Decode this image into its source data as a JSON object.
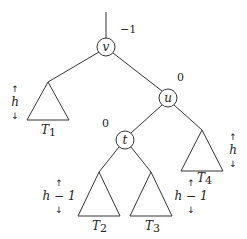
{
  "diagram": {
    "title": "",
    "nodes": [
      {
        "id": "v",
        "label": "v",
        "balance": "−1"
      },
      {
        "id": "u",
        "label": "u",
        "balance": "0"
      },
      {
        "id": "t",
        "label": "t",
        "balance": "0"
      }
    ],
    "subtrees": [
      {
        "id": "T1",
        "name": "T",
        "sub": "1",
        "height": "h"
      },
      {
        "id": "T2",
        "name": "T",
        "sub": "2",
        "height": "h − 1"
      },
      {
        "id": "T3",
        "name": "T",
        "sub": "3",
        "height": "h − 1"
      },
      {
        "id": "T4",
        "name": "T",
        "sub": "4",
        "height": "h"
      }
    ],
    "edges": [
      [
        "root",
        "v"
      ],
      [
        "v",
        "T1"
      ],
      [
        "v",
        "u"
      ],
      [
        "u",
        "t"
      ],
      [
        "u",
        "T4"
      ],
      [
        "t",
        "T2"
      ],
      [
        "t",
        "T3"
      ]
    ],
    "arrows": {
      "up": "↑",
      "down": "↓"
    }
  }
}
